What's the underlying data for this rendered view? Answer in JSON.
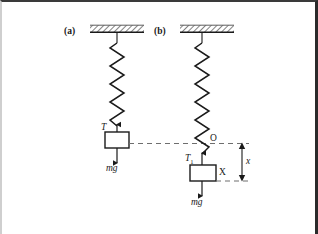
{
  "figure": {
    "type": "physics-free-body-diagram",
    "background_color": "#ffffff",
    "line_color": "#1a1a1a",
    "panels": [
      {
        "id": "a",
        "label": "(a)",
        "ceiling": {
          "hatched": true,
          "x": 88,
          "y": 24,
          "width": 54,
          "height": 7
        },
        "spring": {
          "x": 115,
          "top": 31,
          "bottom": 124,
          "coils": 9,
          "amplitude": 7
        },
        "block": {
          "x": 103,
          "y": 130,
          "width": 24,
          "height": 16,
          "label": ""
        },
        "tension": {
          "label": "T",
          "subscript": "",
          "direction": "up"
        },
        "weight": {
          "label": "mg",
          "direction": "down"
        }
      },
      {
        "id": "b",
        "label": "(b)",
        "ceiling": {
          "hatched": true,
          "x": 178,
          "y": 24,
          "width": 54,
          "height": 7
        },
        "spring": {
          "x": 200,
          "top": 31,
          "bottom": 152,
          "coils": 11,
          "amplitude": 7
        },
        "origin_label": "O",
        "block": {
          "x": 189,
          "y": 163,
          "width": 26,
          "height": 16,
          "label": "X"
        },
        "tension": {
          "label": "T",
          "subscript": "1",
          "direction": "up"
        },
        "weight": {
          "label": "mg",
          "direction": "down"
        },
        "displacement": {
          "label": "x",
          "from_y": 141,
          "to_y": 179
        }
      }
    ],
    "equilibrium_line": {
      "style": "dashed",
      "from_x": 120,
      "to_x": 248,
      "y": 141
    },
    "labels": {
      "panel_a": "(a)",
      "panel_b": "(b)",
      "tension_a": "T",
      "tension_b": "T",
      "tension_b_sub": "1",
      "weight_a": "mg",
      "weight_b": "mg",
      "origin": "O",
      "block_b": "X",
      "displacement": "x"
    }
  },
  "caption": {
    "text": ""
  }
}
